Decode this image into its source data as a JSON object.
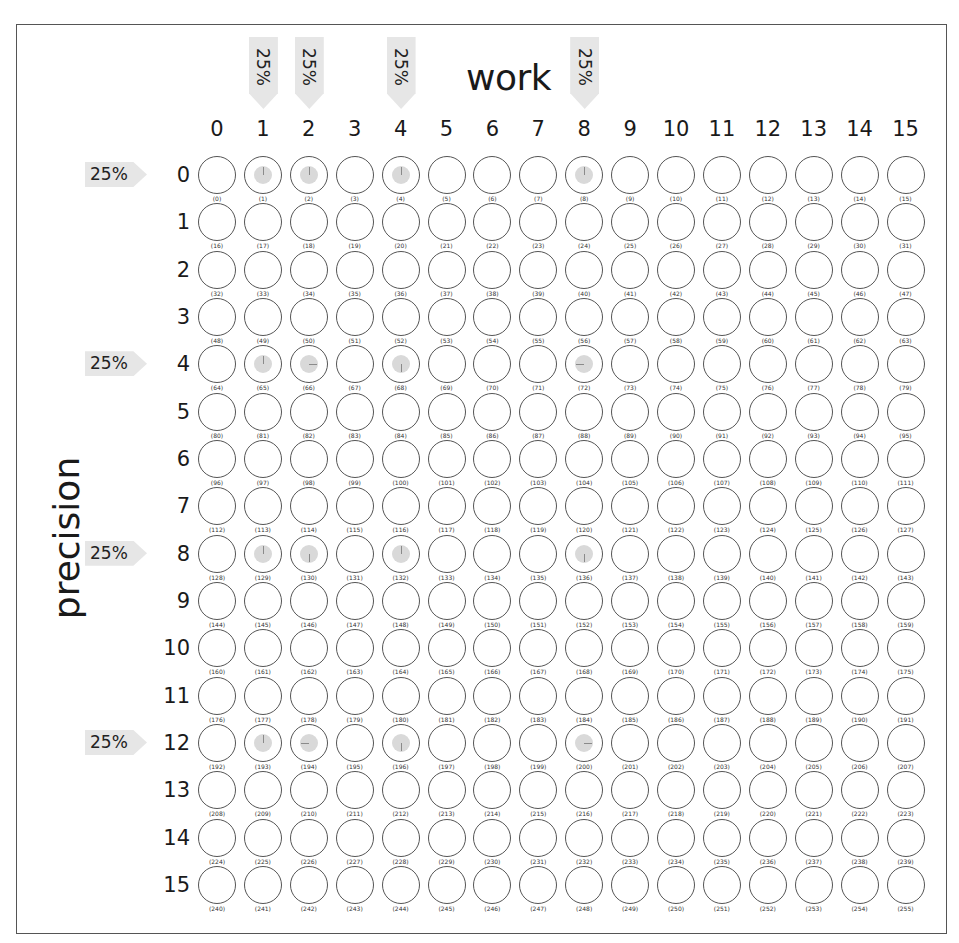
{
  "chart": {
    "x_title": "work",
    "y_title": "precision",
    "columns": [
      "0",
      "1",
      "2",
      "3",
      "4",
      "5",
      "6",
      "7",
      "8",
      "9",
      "10",
      "11",
      "12",
      "13",
      "14",
      "15"
    ],
    "rows": [
      "0",
      "1",
      "2",
      "3",
      "4",
      "5",
      "6",
      "7",
      "8",
      "9",
      "10",
      "11",
      "12",
      "13",
      "14",
      "15"
    ],
    "work_markers": [
      {
        "col": 1,
        "label": "25%"
      },
      {
        "col": 2,
        "label": "25%"
      },
      {
        "col": 4,
        "label": "25%"
      },
      {
        "col": 8,
        "label": "25%"
      }
    ],
    "precision_markers": [
      {
        "row": 0,
        "label": "25%"
      },
      {
        "row": 4,
        "label": "25%"
      },
      {
        "row": 8,
        "label": "25%"
      },
      {
        "row": 12,
        "label": "25%"
      }
    ],
    "filled_cells": [
      {
        "index": 1,
        "tick": "up"
      },
      {
        "index": 2,
        "tick": "up"
      },
      {
        "index": 4,
        "tick": "up"
      },
      {
        "index": 8,
        "tick": "up"
      },
      {
        "index": 65,
        "tick": "up"
      },
      {
        "index": 66,
        "tick": "right"
      },
      {
        "index": 68,
        "tick": "down"
      },
      {
        "index": 72,
        "tick": "left"
      },
      {
        "index": 129,
        "tick": "up"
      },
      {
        "index": 130,
        "tick": "down"
      },
      {
        "index": 132,
        "tick": "up"
      },
      {
        "index": 136,
        "tick": "down"
      },
      {
        "index": 193,
        "tick": "up"
      },
      {
        "index": 194,
        "tick": "left"
      },
      {
        "index": 196,
        "tick": "down"
      },
      {
        "index": 200,
        "tick": "right"
      }
    ],
    "cell_index_format": "(n)",
    "colors": {
      "marker_fill": "#e6e6e6",
      "cell_border": "#555555",
      "filled_dot": "#d9d9d9",
      "text": "#1a1a1a"
    }
  }
}
